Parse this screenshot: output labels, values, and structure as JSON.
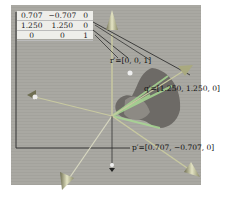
{
  "figure": {
    "matrix": {
      "rows": [
        [
          "0.707",
          "−0.707",
          "0"
        ],
        [
          "1.250",
          "1.250",
          "0"
        ],
        [
          "0",
          "0",
          "1"
        ]
      ]
    },
    "labels": {
      "r": "r′=[0, 0, 1]",
      "q": "q′=[1.250, 1.250, 0]",
      "p": "p′=[0.707, −0.707, 0]"
    },
    "colors": {
      "background": "#a9a8a2",
      "arrow": "#c8c9a0",
      "green": "#9fd08a",
      "line": "#222222"
    }
  }
}
